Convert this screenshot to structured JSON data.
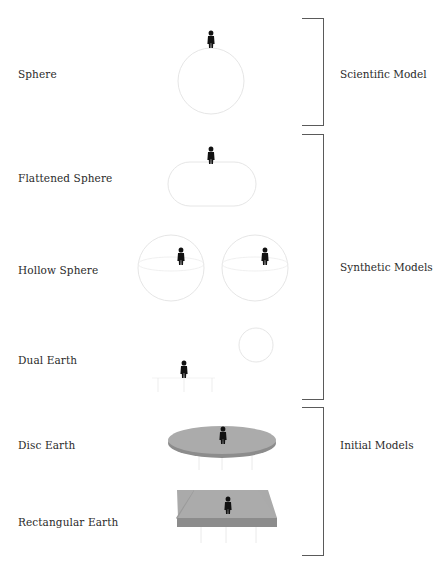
{
  "diagram": {
    "rows": [
      {
        "id": "sphere",
        "label": "Sphere",
        "label_y": 68
      },
      {
        "id": "flattened-sphere",
        "label": "Flattened Sphere",
        "label_y": 172
      },
      {
        "id": "hollow-sphere",
        "label": "Hollow Sphere",
        "label_y": 264
      },
      {
        "id": "dual-earth",
        "label": "Dual Earth",
        "label_y": 354
      },
      {
        "id": "disc-earth",
        "label": "Disc Earth",
        "label_y": 439
      },
      {
        "id": "rectangular-earth",
        "label": "Rectangular Earth",
        "label_y": 516
      }
    ],
    "groups": [
      {
        "id": "scientific",
        "label": "Scientific Model",
        "top": 18,
        "bottom": 125,
        "label_y": 68
      },
      {
        "id": "synthetic",
        "label": "Synthetic Models",
        "top": 134,
        "bottom": 399,
        "label_y": 262
      },
      {
        "id": "initial",
        "label": "Initial Models",
        "top": 407,
        "bottom": 555,
        "label_y": 439
      }
    ],
    "colors": {
      "outline": "#e4e4e4",
      "disc_fill": "#a8a8a8",
      "disc_edge": "#8a8a8a",
      "slab_top": "#a9a9a9",
      "slab_side": "#8c8c8c",
      "figure": "#111111",
      "bracket": "#5a5a5a",
      "text": "#2a2a2a"
    }
  }
}
